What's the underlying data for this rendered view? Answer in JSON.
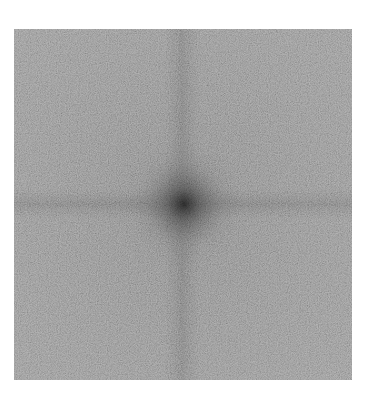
{
  "image": {
    "kind": "fourier-spectrum",
    "alt": "Grayscale noise image with dark central spot and cross-shaped darker bands",
    "colors": {
      "background": "#ffffff",
      "base_gray": "#8a8a8a",
      "band_gray": "#6e6e6e",
      "center_dark": "#2a2a2a"
    }
  }
}
